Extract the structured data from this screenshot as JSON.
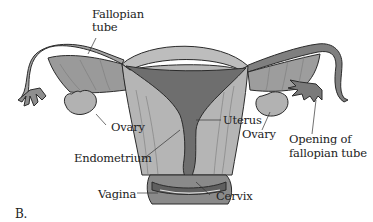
{
  "figure": {
    "caption": "B.",
    "labels": {
      "fallopian_tube_line1": "Fallopian",
      "fallopian_tube_line2": "tube",
      "ovary_left": "Ovary",
      "endometrium": "Endometrium",
      "vagina": "Vagina",
      "uterus": "Uterus",
      "ovary_right": "Ovary",
      "opening_line1": "Opening of",
      "opening_line2": "fallopian tube",
      "cervix": "Cervix"
    },
    "colors": {
      "tissue_light": "#b9b9b9",
      "tissue_mid": "#9c9c9c",
      "cavity_dark": "#6e6e6e",
      "outline": "#2b2b2b"
    }
  }
}
